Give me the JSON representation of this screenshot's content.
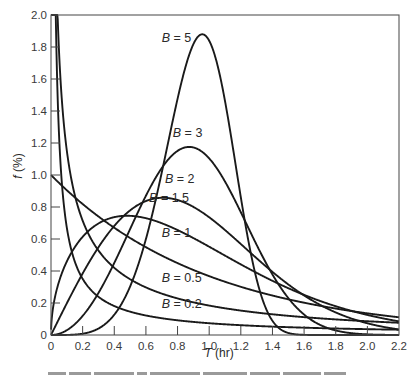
{
  "chart_data": {
    "type": "line",
    "title": "",
    "xlabel": "T (hr)",
    "ylabel": "f (%)",
    "xlim": [
      0,
      2.2
    ],
    "ylim": [
      0,
      2.0
    ],
    "grid": false,
    "legend": "inline curve labels",
    "x_ticks": [
      "0",
      "0.2",
      "0.4",
      "0.6",
      "0.8",
      "1.0",
      "1.2",
      "1.4",
      "1.6",
      "1.8",
      "2.0",
      "2.2"
    ],
    "y_ticks": [
      "0",
      "0.2",
      "0.4",
      "0.6",
      "0.8",
      "1.0",
      "1.2",
      "1.4",
      "1.6",
      "1.8",
      "2.0"
    ],
    "x": [
      0.05,
      0.1,
      0.2,
      0.3,
      0.4,
      0.5,
      0.6,
      0.7,
      0.8,
      0.9,
      1.0,
      1.1,
      1.2,
      1.3,
      1.4,
      1.5,
      1.6,
      1.8,
      2.0,
      2.2
    ],
    "series": [
      {
        "name": "B = 0.2",
        "shape": 0.2,
        "scale": 1.0,
        "values": [
          2.31,
          1.33,
          0.77,
          0.56,
          0.45,
          0.37,
          0.32,
          0.28,
          0.25,
          0.22,
          0.2,
          0.18,
          0.17,
          0.15,
          0.14,
          0.13,
          0.12,
          0.11,
          0.1,
          0.09
        ]
      },
      {
        "name": "B = 0.5",
        "shape": 0.5,
        "scale": 1.0,
        "values": [
          1.79,
          1.15,
          0.71,
          0.53,
          0.42,
          0.35,
          0.3,
          0.26,
          0.23,
          0.2,
          0.18,
          0.17,
          0.15,
          0.14,
          0.13,
          0.12,
          0.11,
          0.1,
          0.09,
          0.08
        ]
      },
      {
        "name": "B = 1",
        "shape": 1.0,
        "scale": 1.0,
        "values": [
          0.95,
          0.9,
          0.82,
          0.74,
          0.67,
          0.61,
          0.55,
          0.5,
          0.45,
          0.41,
          0.37,
          0.33,
          0.3,
          0.27,
          0.25,
          0.22,
          0.2,
          0.17,
          0.14,
          0.11
        ]
      },
      {
        "name": "B = 1.5",
        "shape": 1.5,
        "scale": 1.0,
        "values": [
          0.33,
          0.46,
          0.61,
          0.7,
          0.72,
          0.74,
          0.73,
          0.7,
          0.66,
          0.6,
          0.55,
          0.5,
          0.44,
          0.39,
          0.34,
          0.29,
          0.25,
          0.18,
          0.12,
          0.09
        ]
      },
      {
        "name": "B = 2",
        "shape": 2.0,
        "scale": 1.0,
        "values": [
          0.1,
          0.2,
          0.38,
          0.55,
          0.68,
          0.78,
          0.84,
          0.86,
          0.84,
          0.8,
          0.74,
          0.66,
          0.57,
          0.48,
          0.39,
          0.32,
          0.25,
          0.14,
          0.07,
          0.04
        ]
      },
      {
        "name": "B = 3",
        "shape": 3.0,
        "scale": 1.0,
        "values": [
          0.01,
          0.03,
          0.12,
          0.26,
          0.45,
          0.66,
          0.87,
          1.04,
          1.15,
          1.17,
          1.1,
          0.96,
          0.77,
          0.56,
          0.37,
          0.23,
          0.13,
          0.03,
          0.0,
          0.0
        ]
      },
      {
        "name": "B = 5",
        "shape": 5.0,
        "scale": 1.0,
        "values": [
          0.0,
          0.0,
          0.01,
          0.04,
          0.13,
          0.3,
          0.6,
          1.01,
          1.47,
          1.8,
          1.84,
          1.46,
          0.83,
          0.31,
          0.07,
          0.01,
          0.0,
          0.0,
          0.0,
          0.0
        ]
      }
    ],
    "annotations": [
      {
        "text": "B = 5",
        "x": 0.7,
        "y": 1.83
      },
      {
        "text": "B = 3",
        "x": 0.77,
        "y": 1.24
      },
      {
        "text": "B = 2",
        "x": 0.72,
        "y": 0.95
      },
      {
        "text": "B = 1.5",
        "x": 0.62,
        "y": 0.83
      },
      {
        "text": "B = 1",
        "x": 0.7,
        "y": 0.61
      },
      {
        "text": "B = 0.5",
        "x": 0.7,
        "y": 0.33
      },
      {
        "text": "B = 0.2",
        "x": 0.7,
        "y": 0.17
      }
    ]
  },
  "axes": {
    "xlabel_italic": "T",
    "xlabel_unit": " (hr)",
    "ylabel_italic": "f",
    "ylabel_unit": " (%)"
  }
}
